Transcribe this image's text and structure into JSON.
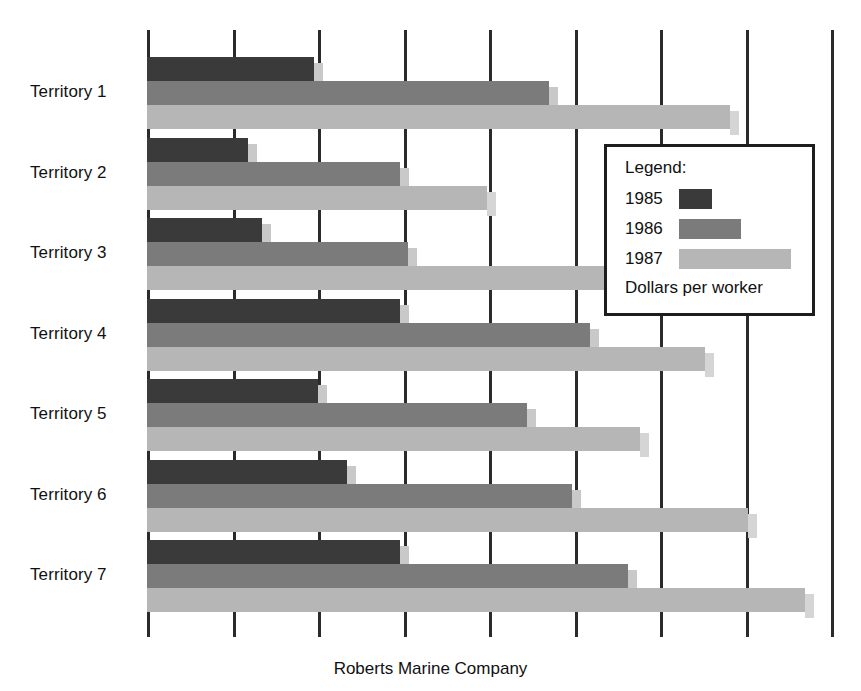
{
  "caption": "Roberts Marine Company",
  "legend": {
    "title": "Legend:",
    "units": "Dollars per worker",
    "entries": [
      {
        "label": "1985",
        "color": "#3a3a3a"
      },
      {
        "label": "1986",
        "color": "#7b7b7b"
      },
      {
        "label": "1987",
        "color": "#b6b6b6"
      }
    ]
  },
  "chart_data": {
    "type": "bar",
    "orientation": "horizontal",
    "title": "Roberts Marine Company",
    "xlabel": "Dollars per worker",
    "ylabel": "",
    "grid": true,
    "legend_position": "inside-right",
    "categories": [
      "Territory 1",
      "Territory 2",
      "Territory 3",
      "Territory 4",
      "Territory 5",
      "Territory 6",
      "Territory 7"
    ],
    "x_gridline_units": [
      0,
      1,
      2,
      3,
      4,
      5,
      6,
      7,
      8
    ],
    "xlim": [
      0,
      8
    ],
    "tick_labels": [],
    "series": [
      {
        "name": "1985",
        "color": "#3a3a3a",
        "values": [
          1.95,
          1.18,
          1.35,
          2.96,
          2.0,
          2.34,
          2.96
        ]
      },
      {
        "name": "1986",
        "color": "#7b7b7b",
        "values": [
          4.7,
          2.96,
          3.05,
          5.18,
          4.45,
          4.97,
          5.62
        ]
      },
      {
        "name": "1987",
        "color": "#b6b6b6",
        "values": [
          6.82,
          3.98,
          5.36,
          6.53,
          5.77,
          7.03,
          7.7
        ]
      }
    ]
  }
}
